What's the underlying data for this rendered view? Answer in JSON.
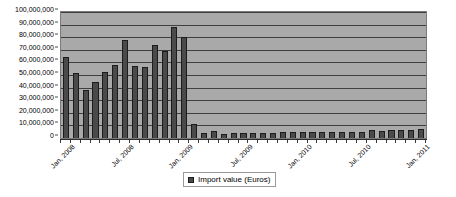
{
  "chart_data": {
    "type": "bar",
    "title": "",
    "xlabel": "",
    "ylabel": "",
    "ylim": [
      0,
      100000000
    ],
    "grid": true,
    "legend_position": "bottom",
    "plot_background": "#a9a9a9",
    "bar_color": "#4a4a4a",
    "bar_border_color": "#1c1c1c",
    "series": [
      {
        "name": "Import value (Euros)",
        "values": [
          64000000,
          51500000,
          37800000,
          44500000,
          52000000,
          58000000,
          78000000,
          57500000,
          56000000,
          74000000,
          69000000,
          88000000,
          80500000,
          11500000,
          4200000,
          5200000,
          3400000,
          3900000,
          3600000,
          4100000,
          3900000,
          4300000,
          4600000,
          4400000,
          4800000,
          4500000,
          5000000,
          4700000,
          5100000,
          4900000,
          4600000,
          6700000,
          5900000,
          6500000,
          6000000,
          6400000,
          6800000
        ]
      }
    ],
    "categories": [
      "Jan, 2008",
      "Feb, 2008",
      "Mar, 2008",
      "Apr, 2008",
      "May, 2008",
      "Jun, 2008",
      "Jul, 2008",
      "Aug, 2008",
      "Sep, 2008",
      "Oct, 2008",
      "Nov, 2008",
      "Dec, 2008",
      "Jan, 2009",
      "Feb, 2009",
      "Mar, 2009",
      "Apr, 2009",
      "May, 2009",
      "Jun, 2009",
      "Jul, 2009",
      "Aug, 2009",
      "Sep, 2009",
      "Oct, 2009",
      "Nov, 2009",
      "Dec, 2009",
      "Jan, 2010",
      "Feb, 2010",
      "Mar, 2010",
      "Apr, 2010",
      "May, 2010",
      "Jun, 2010",
      "Jul, 2010",
      "Aug, 2010",
      "Sep, 2010",
      "Oct, 2010",
      "Nov, 2010",
      "Dec, 2010",
      "Jan, 2011"
    ],
    "y_tick_labels": [
      "0",
      "10,000,000",
      "20,000,000",
      "30,000,000",
      "40,000,000",
      "50,000,000",
      "60,000,000",
      "70,000,000",
      "80,000,000",
      "90,000,000",
      "100,000,000"
    ],
    "y_tick_values": [
      0,
      10000000,
      20000000,
      30000000,
      40000000,
      50000000,
      60000000,
      70000000,
      80000000,
      90000000,
      100000000
    ],
    "x_tick_labels": [
      {
        "label": "Jan, 2008",
        "index": 0
      },
      {
        "label": "Jul, 2008",
        "index": 6
      },
      {
        "label": "Jan, 2009",
        "index": 12
      },
      {
        "label": "Jul, 2009",
        "index": 18
      },
      {
        "label": "Jan, 2010",
        "index": 24
      },
      {
        "label": "Jul, 2010",
        "index": 30
      },
      {
        "label": "Jan, 2011",
        "index": 36
      }
    ]
  },
  "legend": {
    "label": "Import value (Euros)"
  }
}
